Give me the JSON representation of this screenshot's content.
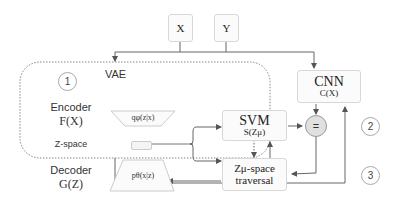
{
  "inputs": {
    "x": "X",
    "y": "Y"
  },
  "vae": {
    "title": "VAE",
    "step": "1",
    "encoder": {
      "label": "Encoder",
      "func": "F(X)",
      "dist": "qφ(z|x)"
    },
    "zspace": {
      "label": "Z-space"
    },
    "decoder": {
      "label": "Decoder",
      "func": "G(Z)",
      "dist": "pθ(x|z)"
    }
  },
  "cnn": {
    "title": "CNN",
    "func": "C(X)"
  },
  "svm": {
    "title": "SVM",
    "func": "S(Zμ)"
  },
  "traversal": {
    "line1": "Zμ-space",
    "line2": "traversal"
  },
  "compare": {
    "symbol": "="
  },
  "steps": {
    "two": "2",
    "three": "3"
  }
}
